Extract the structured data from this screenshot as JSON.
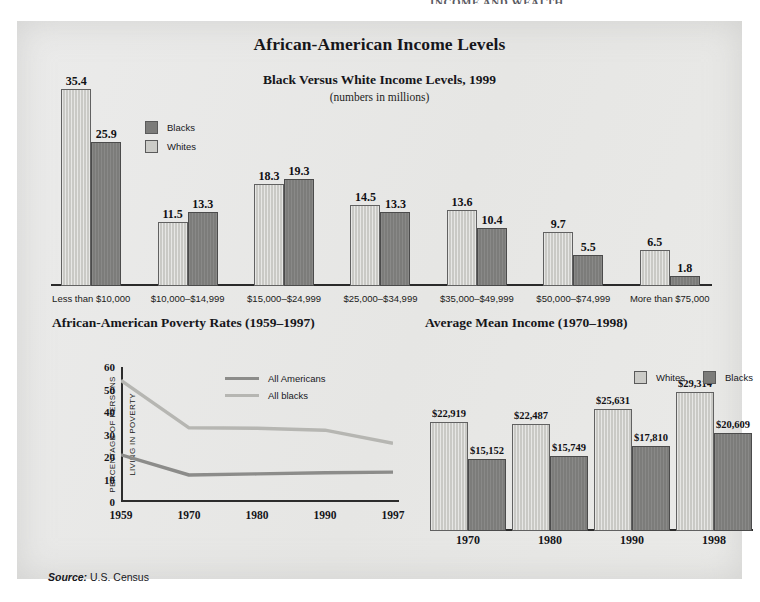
{
  "page_header_partial": "INCOME AND WEALTH",
  "panel": {
    "main_title": "African-American Income Levels",
    "source_label": "Source:",
    "source_value": "U.S. Census"
  },
  "colors": {
    "panel_bg": "#e9e9e7",
    "whites_fill": "#c9c9c5",
    "blacks_fill": "#7c7c7a",
    "all_americans_line": "#8c8c8a",
    "all_blacks_line": "#b6b6b2",
    "axis": "#2a2a2a",
    "text": "#16161a"
  },
  "chart_data": [
    {
      "id": "black-versus-white-income-levels",
      "type": "bar",
      "title": "Black Versus White Income Levels, 1999",
      "subtitle": "(numbers in millions)",
      "xlabel": "",
      "ylabel": "",
      "ylim": [
        0,
        36
      ],
      "grid": false,
      "legend_position": "top-left",
      "categories": [
        "Less than $10,000",
        "$10,000–$14,999",
        "$15,000–$24,999",
        "$25,000–$34,999",
        "$35,000–$49,999",
        "$50,000–$74,999",
        "More than $75,000"
      ],
      "series": [
        {
          "name": "Whites",
          "fill": "#c9c9c5",
          "values": [
            35.4,
            11.5,
            18.3,
            14.5,
            13.6,
            9.7,
            6.5
          ],
          "labels": [
            "35.4",
            "11.5",
            "18.3",
            "14.5",
            "13.6",
            "9.7",
            "6.5"
          ]
        },
        {
          "name": "Blacks",
          "fill": "#7c7c7a",
          "values": [
            25.9,
            13.3,
            19.3,
            13.3,
            10.4,
            5.5,
            1.8
          ],
          "labels": [
            "25.9",
            "13.3",
            "19.3",
            "13.3",
            "10.4",
            "5.5",
            "1.8"
          ]
        }
      ],
      "legend": [
        "Blacks",
        "Whites"
      ]
    },
    {
      "id": "african-american-poverty-rates",
      "type": "line",
      "title": "African-American Poverty Rates (1959–1997)",
      "xlabel": "",
      "ylabel": "PERCENTAGE OF PERSONS LIVING IN POVERTY",
      "ylabel_lines": [
        "PERCENTAGE OF PERSONS",
        "LIVING IN POVERTY"
      ],
      "x": [
        "1959",
        "1970",
        "1980",
        "1990",
        "1997"
      ],
      "yticks": [
        "0",
        "10",
        "20",
        "30",
        "40",
        "50",
        "60"
      ],
      "ylim": [
        0,
        60
      ],
      "grid": false,
      "legend_position": "top-right",
      "series": [
        {
          "name": "All Americans",
          "color": "#8c8c8a",
          "values": [
            21.0,
            12.0,
            12.5,
            13.0,
            13.3
          ]
        },
        {
          "name": "All blacks",
          "color": "#b6b6b2",
          "values": [
            54.0,
            33.0,
            32.8,
            31.9,
            26.1
          ]
        }
      ]
    },
    {
      "id": "average-mean-income",
      "type": "bar",
      "title": "Average Mean Income (1970–1998)",
      "xlabel": "",
      "ylabel": "",
      "ylim": [
        0,
        32000
      ],
      "grid": false,
      "legend_position": "top-right",
      "categories": [
        "1970",
        "1980",
        "1990",
        "1998"
      ],
      "series": [
        {
          "name": "Whites",
          "fill": "#c9c9c5",
          "values": [
            22919,
            22487,
            25631,
            29314
          ],
          "labels": [
            "$22,919",
            "$22,487",
            "$25,631",
            "$29,314"
          ]
        },
        {
          "name": "Blacks",
          "fill": "#7c7c7a",
          "values": [
            15152,
            15749,
            17810,
            20609
          ],
          "labels": [
            "$15,152",
            "$15,749",
            "$17,810",
            "$20,609"
          ]
        }
      ],
      "legend": [
        "Whites",
        "Blacks"
      ]
    }
  ]
}
